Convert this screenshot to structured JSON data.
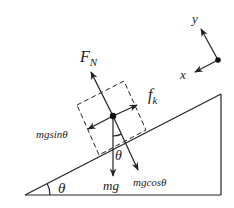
{
  "diagram": {
    "colors": {
      "ink": "#222222",
      "background": "#ffffff"
    },
    "incline": {
      "points": [
        [
          25,
          195
        ],
        [
          221,
          94
        ],
        [
          221,
          195
        ]
      ],
      "angle_label": "θ"
    },
    "block": {
      "center": [
        113,
        116
      ],
      "outline_corners": [
        [
          77,
          105
        ],
        [
          124,
          81
        ],
        [
          146,
          130
        ],
        [
          99,
          155
        ]
      ]
    },
    "forces": [
      {
        "id": "normal",
        "label": "F",
        "subscript": "N",
        "tip": [
          91,
          72
        ],
        "label_pos": [
          80,
          62
        ]
      },
      {
        "id": "friction",
        "label": "f",
        "subscript": "k",
        "tip": [
          137,
          105
        ],
        "label_pos": [
          148,
          100
        ]
      },
      {
        "id": "mg_sin",
        "label": "mgsinθ",
        "tip": [
          88,
          129
        ],
        "label_pos": [
          36,
          138
        ]
      },
      {
        "id": "weight",
        "label": "mg",
        "tip": [
          113,
          176
        ],
        "label_pos": [
          103,
          190
        ]
      },
      {
        "id": "mg_cos",
        "label": "mgcosθ",
        "tip": [
          138,
          170
        ],
        "label_pos": [
          133,
          186
        ]
      }
    ],
    "inner_angle_label": "θ",
    "axes": {
      "origin": [
        218,
        60
      ],
      "y_tip": [
        201,
        29
      ],
      "x_tip": [
        195,
        72
      ],
      "y_label": "y",
      "x_label": "x"
    }
  }
}
